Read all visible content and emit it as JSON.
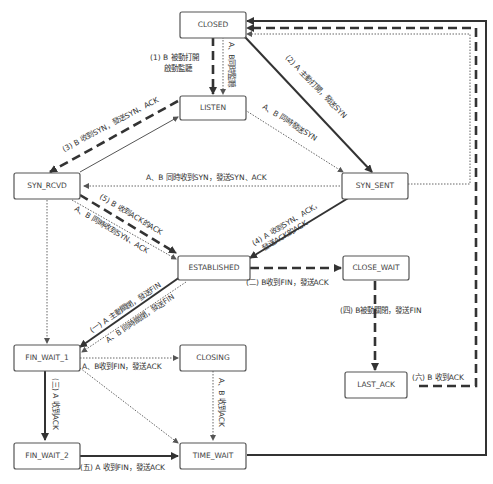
{
  "diagram": {
    "type": "TCP state transition diagram",
    "states": [
      {
        "id": "closed",
        "label": "CLOSED"
      },
      {
        "id": "listen",
        "label": "LISTEN"
      },
      {
        "id": "syn_rcvd",
        "label": "SYN_RCVD"
      },
      {
        "id": "syn_sent",
        "label": "SYN_SENT"
      },
      {
        "id": "established",
        "label": "ESTABLISHED"
      },
      {
        "id": "close_wait",
        "label": "CLOSE_WAIT"
      },
      {
        "id": "last_ack",
        "label": "LAST_ACK"
      },
      {
        "id": "fin_wait_1",
        "label": "FIN_WAIT_1"
      },
      {
        "id": "closing",
        "label": "CLOSING"
      },
      {
        "id": "fin_wait_2",
        "label": "FIN_WAIT_2"
      },
      {
        "id": "time_wait",
        "label": "TIME_WAIT"
      }
    ],
    "edges": {
      "closed_listen_1": "(1) B 被動打開",
      "closed_listen_1b": "啟動監聽",
      "closed_listen_2": "A、B同時監聽",
      "closed_synsent": "(2) A 主動打開，發送SYN",
      "listen_synsent": "A、B 同時發送SYN",
      "listen_synrcvd": "(3) B 收到SYN，發送SYN、ACK",
      "synsent_synrcvd": "A、B 同時收到SYN，發送SYN、ACK",
      "synrcvd_est_5": "(5) B 收到ACK的ACK",
      "synrcvd_est_sim": "A、B 同時收到SYN、ACK",
      "synsent_est_4a": "(4) A 收到SYN、ACK，",
      "synsent_est_4b": "發送ACK的ACK",
      "est_closewait": "(二) B收到FIN，發送ACK",
      "closewait_lastack": "(四) B被動關閉，發送FIN",
      "lastack_closed": "(六) B 收到ACK",
      "est_finwait1_a": "(一) A 主動關閉，發送FIN",
      "est_finwait1_b": "A、B 同時關閉，發送FIN",
      "finwait1_closing": "A、B收到FIN，發送ACK",
      "finwait1_finwait2": "(三) A 收到ACK",
      "closing_timewait": "A、B 收到ACK",
      "finwait2_timewait": "(五) A 收到FIN，發送ACK"
    }
  }
}
